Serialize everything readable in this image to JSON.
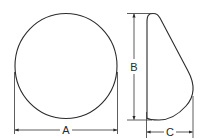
{
  "diagram": {
    "front_view": {
      "shape": "circle",
      "dimension": {
        "label": "A",
        "meaning": "width"
      }
    },
    "side_view": {
      "shape": "tapered-teardrop-profile",
      "dimensions": [
        {
          "label": "B",
          "meaning": "height"
        },
        {
          "label": "C",
          "meaning": "depth"
        }
      ]
    }
  },
  "colors": {
    "line": "#2a2a2a",
    "background": "#ffffff"
  }
}
